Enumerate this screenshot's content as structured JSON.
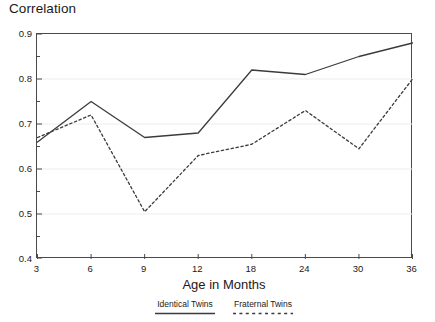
{
  "chart_data": {
    "type": "line",
    "title": "Correlation",
    "xlabel": "Age in Months",
    "ylabel": "",
    "categories": [
      "3",
      "6",
      "9",
      "12",
      "18",
      "24",
      "30",
      "36"
    ],
    "x": [
      3,
      6,
      9,
      12,
      18,
      24,
      30,
      36
    ],
    "ylim": [
      0.4,
      0.9
    ],
    "ytick_labels": [
      "0.4",
      "0.5",
      "0.6",
      "0.7",
      "0.8",
      "0.9"
    ],
    "yticks": [
      0.4,
      0.5,
      0.6,
      0.7,
      0.8,
      0.9
    ],
    "ytick_minor_step": 0.05,
    "grid": "horizontal-major-faint",
    "legend_position": "bottom-center",
    "series": [
      {
        "name": "Identical Twins",
        "style": "solid",
        "color": "#3b3b3b",
        "values": [
          0.66,
          0.75,
          0.67,
          0.68,
          0.82,
          0.81,
          0.85,
          0.88
        ]
      },
      {
        "name": "Fraternal Twins",
        "style": "dashed",
        "color": "#3b3b3b",
        "values": [
          0.67,
          0.72,
          0.505,
          0.63,
          0.655,
          0.73,
          0.645,
          0.8
        ]
      }
    ]
  },
  "legend": {
    "entries": [
      {
        "label": "Identical Twins"
      },
      {
        "label": "Fraternal Twins"
      }
    ]
  },
  "colors": {
    "line": "#3b3b3b",
    "frame": "#4a4a4a",
    "grid": "#ededed",
    "text": "#1a1a1a",
    "background": "#ffffff"
  }
}
